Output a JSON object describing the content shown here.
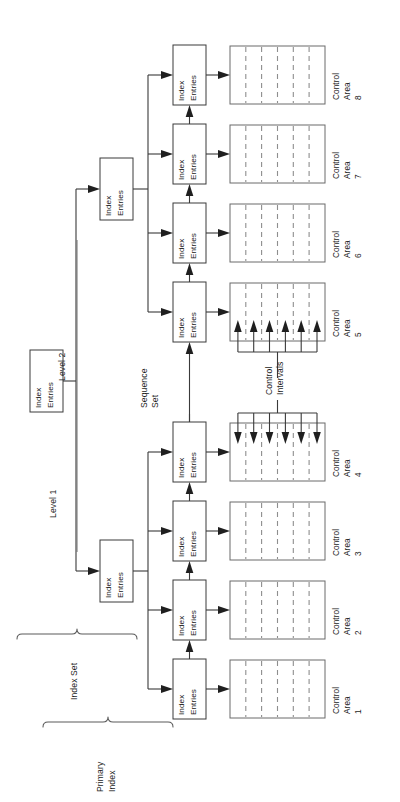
{
  "diagram": {
    "orientation": "rotated-90-ccw",
    "node_label_line1": "Index",
    "node_label_line2": "Entries",
    "labels": {
      "level1": "Level 1",
      "level2": "Level 2",
      "sequence_set_line1": "Sequence",
      "sequence_set_line2": "Set",
      "index_set": "Index Set",
      "primary_index_line1": "Primary",
      "primary_index_line2": "Index",
      "control_intervals_line1": "Control",
      "control_intervals_line2": "Intervals"
    },
    "control_area_label_line1": "Control",
    "control_area_label_line2": "Area",
    "control_areas": [
      {
        "id": "ca1",
        "number": "1",
        "intervals": 6,
        "interval_arrows": "none"
      },
      {
        "id": "ca2",
        "number": "2",
        "intervals": 6,
        "interval_arrows": "none"
      },
      {
        "id": "ca3",
        "number": "3",
        "intervals": 6,
        "interval_arrows": "none"
      },
      {
        "id": "ca4",
        "number": "4",
        "intervals": 6,
        "interval_arrows": "down"
      },
      {
        "id": "ca5",
        "number": "5",
        "intervals": 6,
        "interval_arrows": "up"
      },
      {
        "id": "ca6",
        "number": "6",
        "intervals": 6,
        "interval_arrows": "none"
      },
      {
        "id": "ca7",
        "number": "7",
        "intervals": 6,
        "interval_arrows": "none"
      },
      {
        "id": "ca8",
        "number": "8",
        "intervals": 6,
        "interval_arrows": "none"
      }
    ],
    "sequence_set_nodes": [
      {
        "id": "ss1",
        "label_line1": "Index",
        "label_line2": "Entries"
      },
      {
        "id": "ss2",
        "label_line1": "Index",
        "label_line2": "Entries"
      },
      {
        "id": "ss3",
        "label_line1": "Index",
        "label_line2": "Entries"
      },
      {
        "id": "ss4",
        "label_line1": "Index",
        "label_line2": "Entries"
      },
      {
        "id": "ss5",
        "label_line1": "Index",
        "label_line2": "Entries"
      },
      {
        "id": "ss6",
        "label_line1": "Index",
        "label_line2": "Entries"
      },
      {
        "id": "ss7",
        "label_line1": "Index",
        "label_line2": "Entries"
      },
      {
        "id": "ss8",
        "label_line1": "Index",
        "label_line2": "Entries"
      }
    ],
    "level1_nodes": [
      {
        "id": "l1a",
        "label_line1": "Index",
        "label_line2": "Entries"
      },
      {
        "id": "l1b",
        "label_line1": "Index",
        "label_line2": "Entries"
      }
    ],
    "level2_nodes": [
      {
        "id": "l2root",
        "label_line1": "Index",
        "label_line2": "Entries"
      }
    ],
    "colors": {
      "background": "#ffffff",
      "box_stroke": "#3a3a3a",
      "control_area_stroke": "#6a6a6a",
      "divider_dash": "#8e8e8e",
      "connector": "#3a3a3a",
      "text": "#1c1c1c",
      "brace": "#5a5a5a"
    }
  }
}
